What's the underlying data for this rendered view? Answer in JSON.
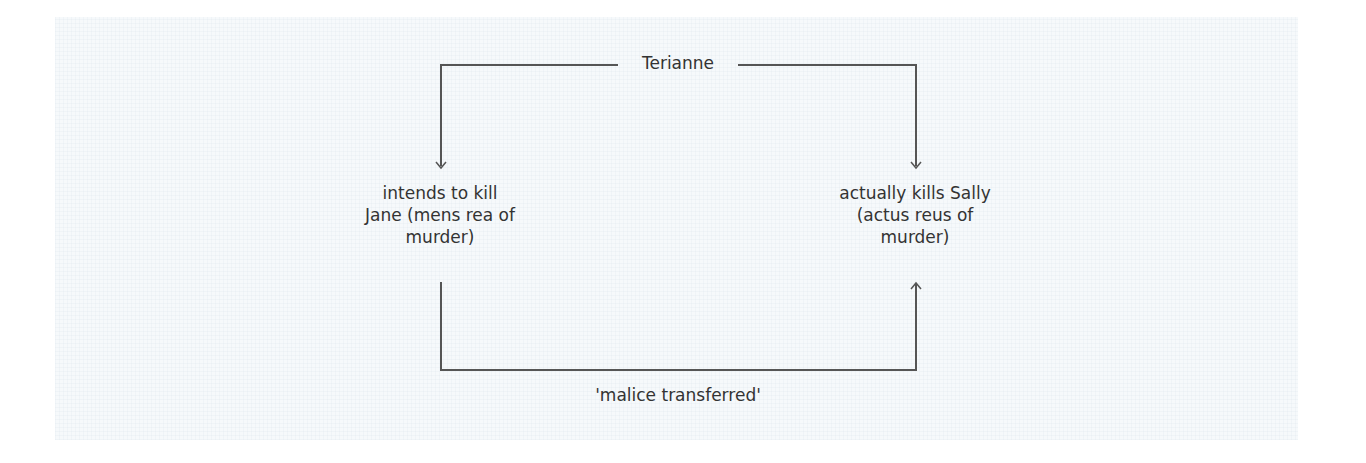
{
  "diagram": {
    "top_label": "Terianne",
    "left_node": {
      "lines": [
        "intends to kill",
        "Jane (mens rea of",
        "murder)"
      ]
    },
    "right_node": {
      "lines": [
        "actually kills Sally",
        "(actus reus of",
        "murder)"
      ]
    },
    "bottom_label": "'malice transferred'",
    "colors": {
      "background": "#f6f9fb",
      "line": "#555555",
      "text": "#333333"
    }
  }
}
